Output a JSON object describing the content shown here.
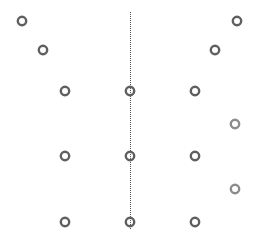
{
  "diagram": {
    "background": "#ffffff",
    "ring_radius": 4.2,
    "ring_stroke": 2.4,
    "colors": {
      "dark": "#5f5f5f",
      "light": "#8c8c8c",
      "line": "#555555"
    },
    "axis_line": {
      "x": 130,
      "y1": 12,
      "y2": 230,
      "style": "dotted"
    },
    "points": [
      {
        "x": 22,
        "y": 21,
        "tone": "dark"
      },
      {
        "x": 43,
        "y": 50,
        "tone": "dark"
      },
      {
        "x": 237,
        "y": 21,
        "tone": "dark"
      },
      {
        "x": 215,
        "y": 50,
        "tone": "dark"
      },
      {
        "x": 65,
        "y": 91,
        "tone": "dark"
      },
      {
        "x": 130,
        "y": 91,
        "tone": "dark"
      },
      {
        "x": 195,
        "y": 91,
        "tone": "dark"
      },
      {
        "x": 235,
        "y": 124,
        "tone": "light"
      },
      {
        "x": 65,
        "y": 156,
        "tone": "dark"
      },
      {
        "x": 130,
        "y": 156,
        "tone": "dark"
      },
      {
        "x": 195,
        "y": 156,
        "tone": "dark"
      },
      {
        "x": 235,
        "y": 189,
        "tone": "light"
      },
      {
        "x": 65,
        "y": 222,
        "tone": "dark"
      },
      {
        "x": 130,
        "y": 222,
        "tone": "dark"
      },
      {
        "x": 195,
        "y": 222,
        "tone": "dark"
      }
    ]
  }
}
